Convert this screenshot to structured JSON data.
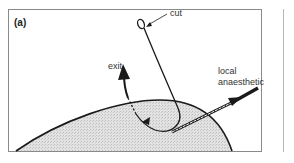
{
  "panel": {
    "label": "(a)"
  },
  "labels": {
    "cut": "cut",
    "exit": "exit",
    "anaesthetic_line1": "local",
    "anaesthetic_line2": "anaesthetic"
  },
  "colors": {
    "line": "#1a1a1a",
    "skin_fill": "#dcdcdc",
    "frame": "#8a8a8a"
  }
}
